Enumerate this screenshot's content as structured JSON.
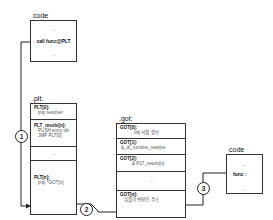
{
  "code_top": {
    "title": "code",
    "dots_top": "...",
    "instruction": "call func@PLT",
    "dots_bottom": "..."
  },
  "plt": {
    "title": ".plt:",
    "entries": [
      {
        "name": "PLT[0]:",
        "lines": [
          "jmp resolver"
        ]
      },
      {
        "name": "PLT_resolv[n]:",
        "lines": [
          "PUSH entry idx",
          "JMP PLT[0]"
        ]
      },
      {
        "name": "...",
        "lines": []
      },
      {
        "name": "PLT[n]:",
        "lines": [
          "jmp *GOT[n]"
        ]
      }
    ]
  },
  "got": {
    "title": ".got:",
    "entries": [
      {
        "name": "GOT[0]:",
        "lines": [
          "obj 식별 정보"
        ]
      },
      {
        "name": "GOT[1]:",
        "lines": [
          "&_dl_runtime_resolve"
        ]
      },
      {
        "name": "GOT[2]:",
        "lines": [
          "& PLT_resolv[n]"
        ]
      },
      {
        "name": "...",
        "lines": []
      },
      {
        "name": "GOT[n]:",
        "lines": [
          "심볼이 변환된 주소"
        ]
      }
    ]
  },
  "code_right": {
    "title": "code",
    "dots_top": "...",
    "label": "func :",
    "dots_bottom": "..."
  },
  "steps": [
    "1",
    "2",
    "3"
  ]
}
